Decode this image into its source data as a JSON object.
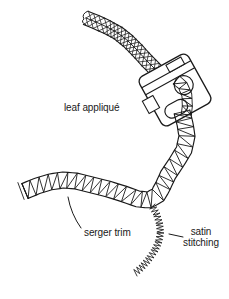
{
  "figure": {
    "labels": {
      "leaf_applique": "leaf appliqué",
      "serger_trim": "serger trim",
      "satin_stitching": "satin stitching"
    },
    "colors": {
      "ink": "#1a1a1a",
      "background": "#ffffff"
    }
  }
}
